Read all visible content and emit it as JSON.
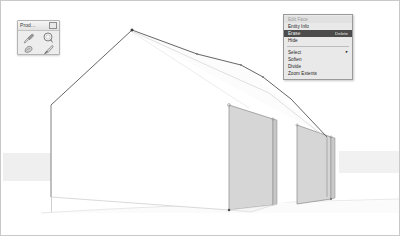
{
  "app": {
    "name": "3D Modeler Viewport",
    "background": "#ffffff",
    "border_color": "#c9c9c9"
  },
  "palette": {
    "title": "Prod...",
    "close_label": "",
    "tools": [
      {
        "name": "eyedropper-tool",
        "label": "Eyedropper"
      },
      {
        "name": "paint-bucket-tool",
        "label": "Paint Bucket"
      },
      {
        "name": "eraser-tool",
        "label": "Eraser"
      },
      {
        "name": "brush-tool",
        "label": "Brush"
      }
    ]
  },
  "context_menu": {
    "header": "Edit Face",
    "items": [
      {
        "label": "Entity Info",
        "shortcut": "",
        "type": "item",
        "selected": false,
        "submenu": false
      },
      {
        "label": "Erase",
        "shortcut": "Delete",
        "type": "item",
        "selected": true,
        "submenu": false
      },
      {
        "label": "Hide",
        "shortcut": "",
        "type": "item",
        "selected": false,
        "submenu": false
      },
      {
        "label": "",
        "shortcut": "",
        "type": "separator",
        "selected": false,
        "submenu": false
      },
      {
        "label": "Select",
        "shortcut": "",
        "type": "item",
        "selected": false,
        "submenu": true
      },
      {
        "label": "Soften",
        "shortcut": "",
        "type": "item",
        "selected": false,
        "submenu": false
      },
      {
        "label": "Divide",
        "shortcut": "",
        "type": "item",
        "selected": false,
        "submenu": false
      },
      {
        "label": "Zoom Extents",
        "shortcut": "",
        "type": "item",
        "selected": false,
        "submenu": false
      }
    ],
    "highlight_color": "#4b4b4b",
    "background_color": "#e9e9e9"
  },
  "scene": {
    "description": "Gable-roofed house model in axonometric view",
    "face_fill_light": "#ffffff",
    "face_fill_shaded": "#d4d4d4",
    "edge_color": "#585858",
    "ground_color": "#f2f2f2",
    "horizon_band_color": "#efefef",
    "axis_color": "#b8b8b8"
  }
}
